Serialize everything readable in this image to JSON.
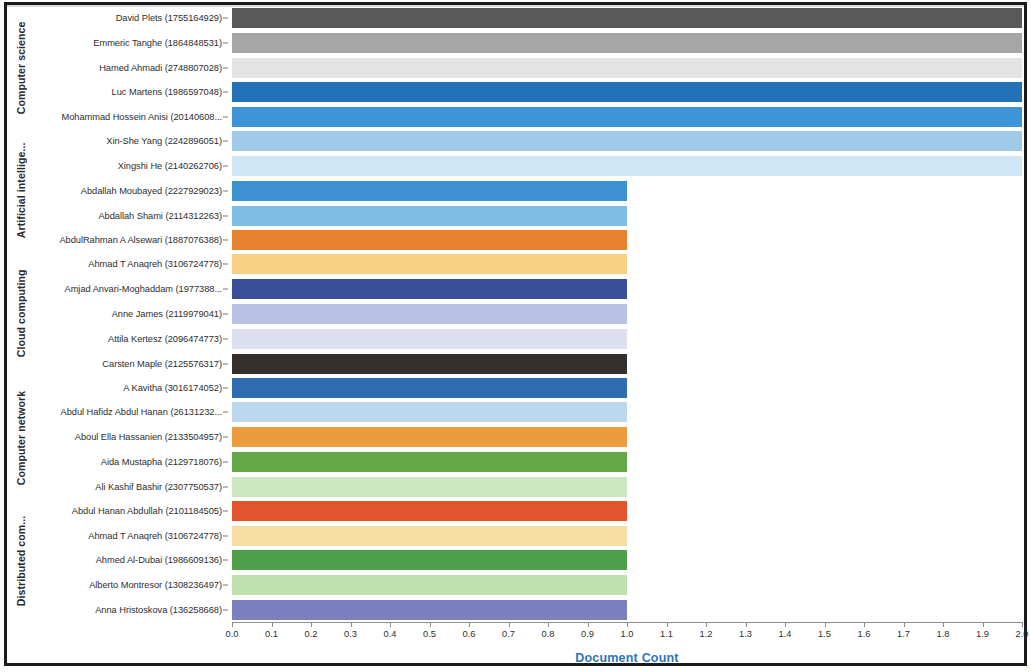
{
  "chart_data": {
    "type": "bar",
    "orientation": "horizontal",
    "title": "",
    "xlabel": "Document Count",
    "ylabel": "",
    "xlim": [
      0.0,
      2.0
    ],
    "grid": false,
    "legend": "none",
    "xticks": [
      "0.0",
      "0.1",
      "0.2",
      "0.3",
      "0.4",
      "0.5",
      "0.6",
      "0.7",
      "0.8",
      "0.9",
      "1.0",
      "1.1",
      "1.2",
      "1.3",
      "1.4",
      "1.5",
      "1.6",
      "1.7",
      "1.8",
      "1.9",
      "2.0"
    ],
    "xtick_values": [
      0.0,
      0.1,
      0.2,
      0.3,
      0.4,
      0.5,
      0.6,
      0.7,
      0.8,
      0.9,
      1.0,
      1.1,
      1.2,
      1.3,
      1.4,
      1.5,
      1.6,
      1.7,
      1.8,
      1.9,
      2.0
    ],
    "groups": [
      {
        "name": "Computer science",
        "bars": [
          {
            "label": "David Plets (1755164929)",
            "value": 2.0,
            "color": "#595959"
          },
          {
            "label": "Emmeric Tanghe (1864848531)",
            "value": 2.0,
            "color": "#a6a6a6"
          },
          {
            "label": "Hamed Ahmadi (2748807028)",
            "value": 2.0,
            "color": "#e3e3e3"
          },
          {
            "label": "Luc Martens (1986597048)",
            "value": 2.0,
            "color": "#2272b8"
          },
          {
            "label": "Mohammad Hossein Anisi (20140608...",
            "value": 2.0,
            "color": "#3d94d6"
          }
        ]
      },
      {
        "name": "Artificial intellige...",
        "bars": [
          {
            "label": "Xin-She Yang (2242896051)",
            "value": 2.0,
            "color": "#9fcbe8"
          },
          {
            "label": "Xingshi He (2140262706)",
            "value": 2.0,
            "color": "#cfe6f7"
          },
          {
            "label": "Abdallah Moubayed (2227929023)",
            "value": 1.0,
            "color": "#3f92d2"
          },
          {
            "label": "Abdallah Shami (2114312263)",
            "value": 1.0,
            "color": "#7fbde4"
          },
          {
            "label": "AbdulRahman A Alsewari (1887076388)",
            "value": 1.0,
            "color": "#e8822e"
          }
        ]
      },
      {
        "name": "Cloud computing",
        "bars": [
          {
            "label": "Ahmad T Anaqreh (3106724778)",
            "value": 1.0,
            "color": "#f8d184"
          },
          {
            "label": "Amjad Anvari-Moghaddam (1977388...",
            "value": 1.0,
            "color": "#3a4e99"
          },
          {
            "label": "Anne James (2119979041)",
            "value": 1.0,
            "color": "#b8c2e4"
          },
          {
            "label": "Attila Kertesz (2096474773)",
            "value": 1.0,
            "color": "#dcdff0"
          },
          {
            "label": "Carsten Maple (2125576317)",
            "value": 1.0,
            "color": "#36302c"
          }
        ]
      },
      {
        "name": "Computer network",
        "bars": [
          {
            "label": "A Kavitha (3016174052)",
            "value": 1.0,
            "color": "#2f6cb2"
          },
          {
            "label": "Abdul Hafidz Abdul Hanan (26131232...",
            "value": 1.0,
            "color": "#bcd8ee"
          },
          {
            "label": "Aboul Ella Hassanien (2133504957)",
            "value": 1.0,
            "color": "#eb9c3f"
          },
          {
            "label": "Aida Mustapha (2129718076)",
            "value": 1.0,
            "color": "#62a844"
          },
          {
            "label": "Ali Kashif Bashir (2307750537)",
            "value": 1.0,
            "color": "#cbe7bf"
          }
        ]
      },
      {
        "name": "Distributed com...",
        "bars": [
          {
            "label": "Abdul Hanan Abdullah (2101184505)",
            "value": 1.0,
            "color": "#e2552c"
          },
          {
            "label": "Ahmad T Anaqreh (3106724778)",
            "value": 1.0,
            "color": "#f5dda4"
          },
          {
            "label": "Ahmed Al-Dubai (1986609136)",
            "value": 1.0,
            "color": "#4e9e4a"
          },
          {
            "label": "Alberto Montresor (1308236497)",
            "value": 1.0,
            "color": "#bee0af"
          },
          {
            "label": "Anna Hristoskova (136258668)",
            "value": 1.0,
            "color": "#7c80c0"
          }
        ]
      }
    ]
  },
  "axis": {
    "x_title": "Document Count",
    "x_title_color": "#2e75b6"
  }
}
